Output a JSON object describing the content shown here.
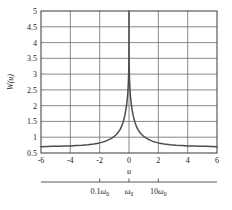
{
  "chart_data": {
    "type": "line",
    "title": "",
    "xlabel": "u",
    "ylabel": "W(u)",
    "xlim": [
      -6,
      6
    ],
    "ylim": [
      0.5,
      5
    ],
    "grid": true,
    "legend": null,
    "x_ticks": [
      "-6",
      "-4",
      "-2",
      "0",
      "2",
      "4",
      "6"
    ],
    "x_tick_values": [
      -6,
      -4,
      -2,
      0,
      2,
      4,
      6
    ],
    "y_ticks": [
      "0.5",
      "1",
      "1.5",
      "2",
      "2.5",
      "3",
      "3.5",
      "4",
      "4.5",
      "5"
    ],
    "y_tick_values": [
      0.5,
      1,
      1.5,
      2,
      2.5,
      3,
      3.5,
      4,
      4.5,
      5
    ],
    "series": [
      {
        "name": "W(u)",
        "color": "#4d4d4d",
        "x": [
          -6.0,
          -5.6,
          -5.2,
          -4.8,
          -4.4,
          -4.0,
          -3.6,
          -3.2,
          -2.8,
          -2.4,
          -2.0,
          -1.8,
          -1.6,
          -1.4,
          -1.2,
          -1.0,
          -0.9,
          -0.8,
          -0.7,
          -0.6,
          -0.5,
          -0.42,
          -0.35,
          -0.28,
          -0.22,
          -0.17,
          -0.13,
          -0.1,
          -0.075,
          -0.055,
          -0.04,
          -0.028,
          -0.02,
          -0.013,
          -0.008,
          -0.004,
          -0.0015,
          0.0,
          0.0015,
          0.004,
          0.008,
          0.013,
          0.02,
          0.028,
          0.04,
          0.055,
          0.075,
          0.1,
          0.13,
          0.17,
          0.22,
          0.28,
          0.35,
          0.42,
          0.5,
          0.6,
          0.7,
          0.8,
          0.9,
          1.0,
          1.2,
          1.4,
          1.6,
          1.8,
          2.0,
          2.4,
          2.8,
          3.2,
          3.6,
          4.0,
          4.4,
          4.8,
          5.2,
          5.6,
          6.0
        ],
        "y": [
          0.7,
          0.705,
          0.71,
          0.715,
          0.72,
          0.725,
          0.735,
          0.745,
          0.76,
          0.785,
          0.82,
          0.845,
          0.875,
          0.915,
          0.965,
          1.03,
          1.07,
          1.12,
          1.18,
          1.25,
          1.35,
          1.45,
          1.56,
          1.7,
          1.85,
          2.0,
          2.15,
          2.3,
          2.46,
          2.62,
          2.78,
          2.95,
          3.12,
          3.32,
          3.58,
          3.9,
          4.35,
          5.0,
          4.35,
          3.9,
          3.58,
          3.32,
          3.12,
          2.95,
          2.78,
          2.62,
          2.46,
          2.3,
          2.15,
          2.0,
          1.85,
          1.7,
          1.56,
          1.45,
          1.35,
          1.25,
          1.18,
          1.12,
          1.07,
          1.03,
          0.965,
          0.915,
          0.875,
          0.845,
          0.82,
          0.785,
          0.76,
          0.745,
          0.735,
          0.725,
          0.72,
          0.715,
          0.71,
          0.705,
          0.7
        ]
      }
    ],
    "secondary_axis": {
      "label": "",
      "ticks": [
        {
          "value": -2,
          "text_main": "0.1",
          "text_symbol": "ω",
          "text_sub": "0"
        },
        {
          "value": 0,
          "text_main": "",
          "text_symbol": "ω",
          "text_sub": "0"
        },
        {
          "value": 2,
          "text_main": "10",
          "text_symbol": "ω",
          "text_sub": "0"
        }
      ]
    }
  },
  "figure": {
    "axis_color": "#5a5a5a",
    "grid_color": "#6b6b6b",
    "curve_color": "#4d4d4d",
    "text_color": "#1a1a1a",
    "background": "#ffffff"
  }
}
